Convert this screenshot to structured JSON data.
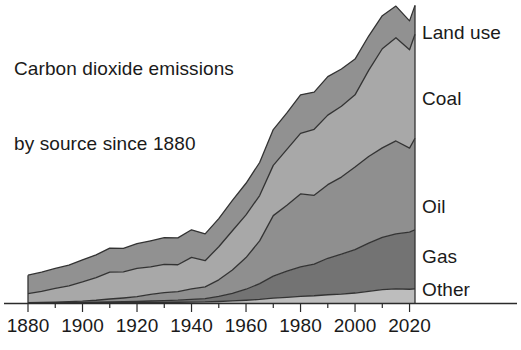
{
  "title": {
    "line1": "Carbon dioxide emissions",
    "line2": "by source since 1880"
  },
  "colors": {
    "land_use": "#919191",
    "coal": "#a8a8a8",
    "oil": "#8f8f8f",
    "gas": "#737373",
    "other": "#bdbdbd",
    "outline": "#333333",
    "axis": "#2b2b2b",
    "text": "#1a1a1a",
    "background": "#ffffff"
  },
  "labels": {
    "land_use": "Land use",
    "coal": "Coal",
    "oil": "Oil",
    "gas": "Gas",
    "other": "Other"
  },
  "axis": {
    "ticks_major": [
      "1880",
      "1900",
      "1920",
      "1940",
      "1960",
      "1980",
      "2000",
      "2020"
    ],
    "tick_values_major": [
      1880,
      1900,
      1920,
      1940,
      1960,
      1980,
      2000,
      2020
    ],
    "tick_values_minor": [
      1890,
      1910,
      1930,
      1950,
      1970,
      1990,
      2010
    ],
    "xlim": [
      1880,
      2022
    ],
    "ylim": [
      0,
      42
    ]
  },
  "chart_data": {
    "type": "area",
    "title": "Carbon dioxide emissions by source since 1880",
    "subtitle": "",
    "xlabel": "",
    "ylabel": "",
    "stacked": true,
    "grid": false,
    "legend_position": "right-inline",
    "xlim": [
      1880,
      2022
    ],
    "ylim": [
      0,
      42
    ],
    "axis_ticks_major": [
      1880,
      1900,
      1920,
      1940,
      1960,
      1980,
      2000,
      2020
    ],
    "axis_ticks_minor": [
      1890,
      1910,
      1930,
      1950,
      1970,
      1990,
      2010
    ],
    "units": "billion tonnes CO2 per year",
    "x": [
      1880,
      1885,
      1890,
      1895,
      1900,
      1905,
      1910,
      1915,
      1920,
      1925,
      1930,
      1935,
      1940,
      1945,
      1950,
      1955,
      1960,
      1965,
      1970,
      1975,
      1980,
      1985,
      1990,
      1995,
      2000,
      2005,
      2010,
      2015,
      2020,
      2022
    ],
    "series": [
      {
        "name": "Other",
        "order": 1,
        "values": [
          0.02,
          0.02,
          0.03,
          0.03,
          0.04,
          0.05,
          0.06,
          0.06,
          0.07,
          0.09,
          0.1,
          0.11,
          0.14,
          0.15,
          0.22,
          0.3,
          0.4,
          0.52,
          0.7,
          0.82,
          0.95,
          1.05,
          1.2,
          1.3,
          1.45,
          1.7,
          1.95,
          2.05,
          2.0,
          2.05
        ]
      },
      {
        "name": "Gas",
        "order": 2,
        "values": [
          0.01,
          0.02,
          0.03,
          0.04,
          0.05,
          0.07,
          0.1,
          0.12,
          0.15,
          0.2,
          0.25,
          0.3,
          0.4,
          0.5,
          0.75,
          1.1,
          1.6,
          2.3,
          3.2,
          3.8,
          4.3,
          4.6,
          5.3,
          5.8,
          6.3,
          7.0,
          7.6,
          8.0,
          8.3,
          8.6
        ]
      },
      {
        "name": "Oil",
        "order": 3,
        "values": [
          0.02,
          0.04,
          0.07,
          0.12,
          0.18,
          0.28,
          0.42,
          0.55,
          0.7,
          0.95,
          1.15,
          1.25,
          1.5,
          1.7,
          2.4,
          3.4,
          4.6,
          6.2,
          8.8,
          9.6,
          10.6,
          10.0,
          10.7,
          11.2,
          12.0,
          12.6,
          13.0,
          13.5,
          12.2,
          13.3
        ]
      },
      {
        "name": "Coal",
        "order": 4,
        "values": [
          1.3,
          1.6,
          2.0,
          2.3,
          2.8,
          3.3,
          3.9,
          3.8,
          4.1,
          4.0,
          4.1,
          3.9,
          4.6,
          3.8,
          4.8,
          5.7,
          6.2,
          6.6,
          7.3,
          8.1,
          8.8,
          9.6,
          10.1,
          10.3,
          10.5,
          12.5,
          14.4,
          15.0,
          14.3,
          15.1
        ]
      },
      {
        "name": "Land use",
        "order": 5,
        "values": [
          2.7,
          2.8,
          2.9,
          3.0,
          3.2,
          3.3,
          3.5,
          3.4,
          3.6,
          3.8,
          3.9,
          3.9,
          4.0,
          3.9,
          4.1,
          4.4,
          4.6,
          4.8,
          5.2,
          5.3,
          5.6,
          5.4,
          5.6,
          5.4,
          5.2,
          5.0,
          4.8,
          4.6,
          4.2,
          4.2
        ]
      }
    ],
    "totals": [
      4.05,
      4.48,
      5.03,
      5.49,
      6.27,
      7.0,
      7.98,
      7.93,
      8.62,
      9.04,
      9.5,
      9.46,
      10.64,
      10.05,
      12.27,
      14.9,
      17.4,
      20.42,
      25.2,
      27.62,
      30.25,
      30.65,
      32.9,
      34.0,
      35.45,
      38.8,
      41.75,
      43.15,
      41.0,
      43.25
    ]
  }
}
